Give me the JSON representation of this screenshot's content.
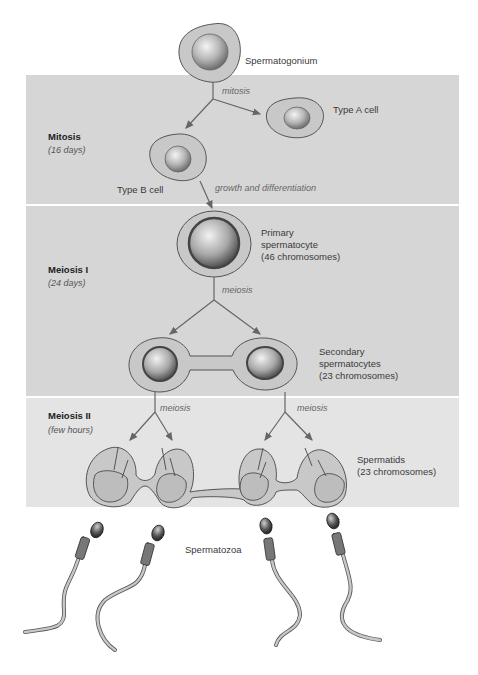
{
  "phases": [
    {
      "title": "Mitosis",
      "duration": "(16 days)"
    },
    {
      "title": "Meiosis I",
      "duration": "(24 days)"
    },
    {
      "title": "Meiosis II",
      "duration": "(few hours)"
    }
  ],
  "cells": {
    "spermatogonium": "Spermatogonium",
    "type_a": "Type A cell",
    "type_b": "Type B cell",
    "primary_line1": "Primary",
    "primary_line2": "spermatocyte",
    "primary_line3": "(46 chromosomes)",
    "secondary_line1": "Secondary",
    "secondary_line2": "spermatocytes",
    "secondary_line3": "(23 chromosomes)",
    "spermatids_line1": "Spermatids",
    "spermatids_line2": "(23 chromosomes)",
    "spermatozoa": "Spermatozoa"
  },
  "processes": {
    "mitosis": "mitosis",
    "growth": "growth and differentiation",
    "meiosis1": "meiosis",
    "meiosis2_left": "meiosis",
    "meiosis2_right": "meiosis"
  },
  "colors": {
    "band": "#d6d6d6",
    "band_light": "#e4e4e4",
    "cytoplasm": "#c8c8c8",
    "outline": "#555555",
    "arrow": "#666666"
  }
}
